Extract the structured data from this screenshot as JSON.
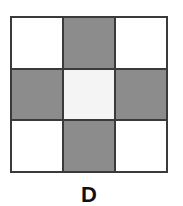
{
  "figure": {
    "label": "D",
    "grid": {
      "rows": 3,
      "cols": 3,
      "cells": [
        [
          "white",
          "gray",
          "white"
        ],
        [
          "gray",
          "white",
          "gray"
        ],
        [
          "white",
          "gray",
          "white"
        ]
      ]
    },
    "colors": {
      "shaded": "#8c8c8c",
      "plain": "#ffffff",
      "border": "#3a3a3a"
    }
  }
}
